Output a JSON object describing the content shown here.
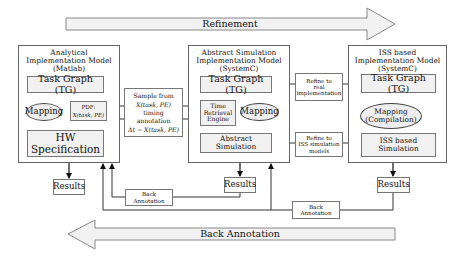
{
  "arrows": {
    "refinement": "Refinement",
    "back_annotation": "Back Annotation"
  },
  "analytical": {
    "title": "Analytical\nImplementation Model\n(Matlab)",
    "task_graph": "Task Graph (TG)",
    "mapping": "Mapping",
    "pdf_label": "PDF:",
    "pdf_formula": "X(task, PE)",
    "hw_spec": "HW Specification",
    "results": "Results"
  },
  "sample_note": {
    "line1": "Sample from",
    "line2": "X(task, PE)",
    "line3": "timing",
    "line4": "annotation",
    "line5": "Δt ∼ X(task, PE)"
  },
  "abstract_sim": {
    "title": "Abstract Simulation\nImplementation Model\n(SystemC)",
    "task_graph": "Task Graph (TG)",
    "time_retrieval": "Time\nRetrieval\nEngine",
    "mapping": "Mapping",
    "simulation": "Abstract\nSimulation",
    "results": "Results"
  },
  "refine_notes": {
    "real": "Refine to\nreal\nimplementation",
    "iss": "Refine to\nISS simulation\nmodels"
  },
  "iss_model": {
    "title": "ISS based\nImplementation Model\n(SystemC)",
    "task_graph": "Task Graph (TG)",
    "mapping": "Mapping\n(Compilation)",
    "simulation": "ISS based\nSimulation",
    "results": "Results"
  },
  "back_annotation_notes": {
    "left": "Back\nAnnotation",
    "right": "Back\nAnnotation"
  },
  "colors": {
    "arrow_fill": "#f2f2f2",
    "inner_fill": "#f1f1f1",
    "line": "#333333"
  }
}
